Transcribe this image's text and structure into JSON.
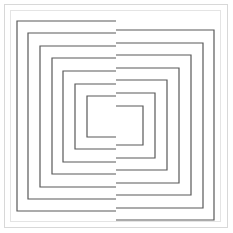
{
  "figure": {
    "canvas": {
      "width": 233,
      "height": 233,
      "background": "#ffffff"
    },
    "page_frame": {
      "x": 4,
      "y": 4,
      "width": 224,
      "height": 224,
      "stroke": "#d8d8d8",
      "stroke_width": 1
    },
    "inner_frame": {
      "x": 10,
      "y": 10,
      "width": 211,
      "height": 212,
      "stroke": "#e4e4e4",
      "stroke_width": 1
    },
    "line_color": "#595959",
    "line_width": 1.2,
    "split_x": 116,
    "ring_count": 12,
    "left_rings": [
      {
        "index": 0,
        "label": "left-ring-1",
        "top": 21,
        "bottom": 211,
        "outer_x": 17,
        "join_x": 116
      },
      {
        "index": 1,
        "label": "left-ring-2",
        "top": 33,
        "bottom": 199,
        "outer_x": 28,
        "join_x": 116
      },
      {
        "index": 2,
        "label": "left-ring-3",
        "top": 46,
        "bottom": 187,
        "outer_x": 40,
        "join_x": 116
      },
      {
        "index": 3,
        "label": "left-ring-4",
        "top": 58,
        "bottom": 174,
        "outer_x": 52,
        "join_x": 116
      },
      {
        "index": 4,
        "label": "left-ring-5",
        "top": 71,
        "bottom": 162,
        "outer_x": 63,
        "join_x": 116
      },
      {
        "index": 5,
        "label": "left-ring-6",
        "top": 84,
        "bottom": 149,
        "outer_x": 75,
        "join_x": 116
      },
      {
        "index": 6,
        "label": "left-ring-7",
        "top": 96,
        "bottom": 137,
        "outer_x": 87,
        "join_x": 116
      }
    ],
    "right_rings": [
      {
        "index": 0,
        "label": "right-ring-1",
        "top": 30,
        "bottom": 220,
        "outer_x": 214,
        "join_x": 116
      },
      {
        "index": 1,
        "label": "right-ring-2",
        "top": 43,
        "bottom": 208,
        "outer_x": 203,
        "join_x": 116
      },
      {
        "index": 2,
        "label": "right-ring-3",
        "top": 55,
        "bottom": 195,
        "outer_x": 191,
        "join_x": 116
      },
      {
        "index": 3,
        "label": "right-ring-4",
        "top": 68,
        "bottom": 183,
        "outer_x": 179,
        "join_x": 116
      },
      {
        "index": 4,
        "label": "right-ring-5",
        "top": 80,
        "bottom": 170,
        "outer_x": 167,
        "join_x": 116
      },
      {
        "index": 5,
        "label": "right-ring-6",
        "top": 93,
        "bottom": 158,
        "outer_x": 155,
        "join_x": 116
      },
      {
        "index": 6,
        "label": "right-ring-7",
        "top": 106,
        "bottom": 145,
        "outer_x": 143,
        "join_x": 116
      }
    ]
  }
}
